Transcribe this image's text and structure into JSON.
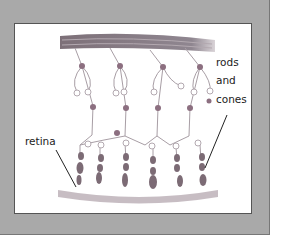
{
  "diagram": {
    "labels": {
      "rods_line1": "rods",
      "rods_line2": "and",
      "rods_line3": "cones",
      "retina": "retina"
    },
    "colors": {
      "frame": "#a9a9a9",
      "panel": "#ffffff",
      "nerve": "#8a7e86",
      "cell": "#8c6f80",
      "retina_base": "#b9adb4"
    }
  }
}
